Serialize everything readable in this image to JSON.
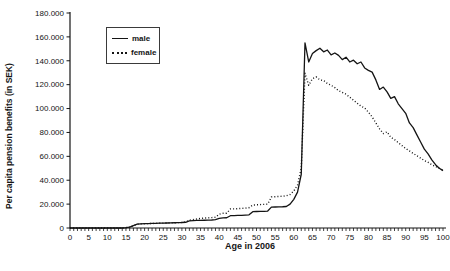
{
  "chart_data": {
    "type": "line",
    "title": "",
    "xlabel": "Age in 2006",
    "ylabel": "Per capita pension benefits (in SEK)",
    "ylim": [
      0,
      180000
    ],
    "ytick_step": 20000,
    "ytick_labels": [
      "0",
      "20.000",
      "40.000",
      "60.000",
      "80.000",
      "100.000",
      "120.000",
      "140.000",
      "160.000",
      "180.000"
    ],
    "xlim": [
      0,
      100
    ],
    "xtick_step": 5,
    "xminor_tick_step": 1,
    "grid": "off",
    "legend_position": "top-left-inside",
    "line_color": "#141414",
    "ages": [
      0,
      1,
      2,
      3,
      4,
      5,
      6,
      7,
      8,
      9,
      10,
      11,
      12,
      13,
      14,
      15,
      16,
      17,
      18,
      19,
      20,
      21,
      22,
      23,
      24,
      25,
      26,
      27,
      28,
      29,
      30,
      31,
      32,
      33,
      34,
      35,
      36,
      37,
      38,
      39,
      40,
      41,
      42,
      43,
      44,
      45,
      46,
      47,
      48,
      49,
      50,
      51,
      52,
      53,
      54,
      55,
      56,
      57,
      58,
      59,
      60,
      61,
      62,
      63,
      64,
      65,
      66,
      67,
      68,
      69,
      70,
      71,
      72,
      73,
      74,
      75,
      76,
      77,
      78,
      79,
      80,
      81,
      82,
      83,
      84,
      85,
      86,
      87,
      88,
      89,
      90,
      91,
      92,
      93,
      94,
      95,
      96,
      97,
      98,
      99,
      100
    ],
    "series": [
      {
        "name": "male",
        "style": "solid",
        "values": [
          0,
          0,
          0,
          0,
          0,
          0,
          0,
          0,
          0,
          0,
          0,
          0,
          0,
          0,
          0,
          300,
          800,
          2000,
          3200,
          3500,
          3600,
          3700,
          3800,
          3900,
          4000,
          4100,
          4200,
          4300,
          4400,
          4500,
          4600,
          4800,
          6000,
          6200,
          6300,
          6400,
          6500,
          6600,
          6700,
          7000,
          8000,
          8500,
          8600,
          10300,
          10400,
          10500,
          10600,
          10800,
          11000,
          13700,
          13800,
          13900,
          14000,
          14200,
          17500,
          17600,
          17700,
          17800,
          18000,
          20000,
          24000,
          30000,
          45000,
          155000,
          139000,
          146000,
          148500,
          150500,
          147500,
          149000,
          145000,
          146500,
          144500,
          141000,
          143000,
          139000,
          140500,
          137500,
          139000,
          134000,
          132000,
          130500,
          124000,
          116000,
          118000,
          114000,
          108500,
          110000,
          104000,
          100000,
          96000,
          88000,
          84000,
          78000,
          72000,
          66000,
          62000,
          57000,
          53000,
          50000,
          48000
        ]
      },
      {
        "name": "female",
        "style": "dotted",
        "values": [
          0,
          0,
          0,
          0,
          0,
          0,
          0,
          0,
          0,
          0,
          0,
          0,
          0,
          0,
          0,
          300,
          800,
          2000,
          3200,
          3500,
          3600,
          3700,
          3800,
          3900,
          4000,
          4100,
          4200,
          4300,
          4400,
          4500,
          4700,
          5000,
          6500,
          7000,
          7500,
          8000,
          8300,
          8500,
          8700,
          9000,
          11500,
          12300,
          12400,
          15900,
          16000,
          16200,
          16400,
          16600,
          17000,
          19200,
          19400,
          19600,
          19800,
          20000,
          26000,
          26200,
          26400,
          26600,
          27000,
          28000,
          31000,
          36000,
          50000,
          129500,
          119500,
          125000,
          126500,
          124000,
          123500,
          121000,
          119500,
          117500,
          115000,
          113500,
          112000,
          109500,
          107000,
          104500,
          102000,
          100500,
          97000,
          93000,
          88000,
          83000,
          79000,
          80500,
          76000,
          74000,
          71500,
          69000,
          66500,
          64500,
          62500,
          60500,
          58500,
          56500,
          55000,
          53000,
          51500,
          50000,
          48500
        ]
      }
    ]
  }
}
